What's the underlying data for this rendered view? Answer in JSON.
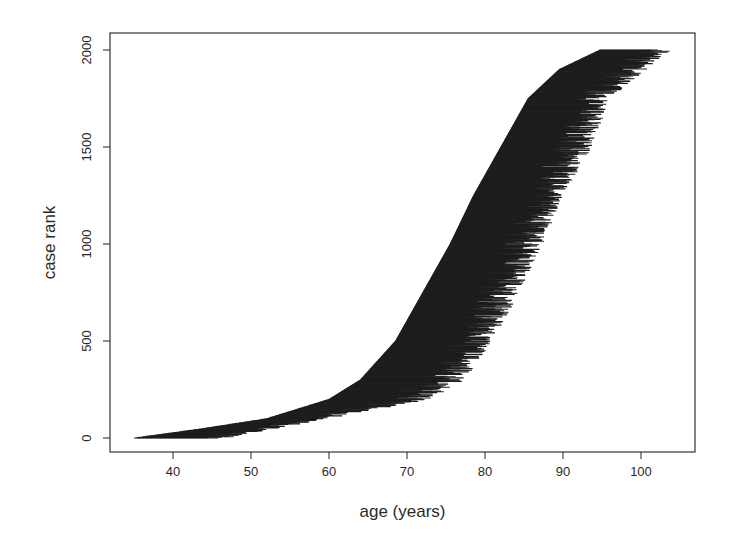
{
  "chart_data": {
    "type": "segments",
    "title": "",
    "xlabel": "age (years)",
    "ylabel": "case rank",
    "xlim": [
      33,
      107
    ],
    "ylim": [
      -80,
      2100
    ],
    "x_ticks": [
      40,
      50,
      60,
      70,
      80,
      90,
      100
    ],
    "y_ticks": [
      0,
      500,
      1000,
      1500,
      2000
    ],
    "grid": false,
    "legend": null,
    "n_cases": 2000,
    "start_age_envelope": {
      "rank": [
        0,
        50,
        100,
        200,
        300,
        500,
        750,
        1000,
        1250,
        1500,
        1750,
        1900,
        2000
      ],
      "age": [
        35,
        44,
        52,
        60,
        64,
        68.5,
        72,
        75.5,
        78.5,
        82,
        85.5,
        89.5,
        94.7
      ]
    },
    "end_age_envelope": {
      "rank": [
        0,
        100,
        200,
        300,
        500,
        750,
        1000,
        1250,
        1500,
        1750,
        2000
      ],
      "age": [
        47,
        60,
        73,
        77.5,
        81,
        84.5,
        87.5,
        90,
        94,
        96,
        104
      ]
    },
    "color": "#1c1c1c"
  },
  "layout": {
    "plot_px": {
      "left": 110,
      "top": 33,
      "right": 695,
      "bottom": 452
    },
    "x_px_map": {
      "value_a": 40,
      "px_a": 173,
      "value_b": 100,
      "px_b": 641
    },
    "y_px_map": {
      "value_a": 0,
      "px_a": 438,
      "value_b": 2000,
      "px_b": 50
    }
  }
}
